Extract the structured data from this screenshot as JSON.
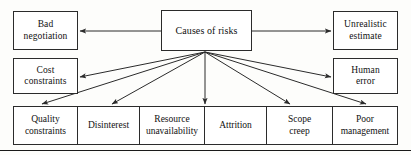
{
  "diagram": {
    "title": "Causes of risks",
    "type": "cause-and-effect-fan-diagram",
    "hub": {
      "label": "Causes of risks",
      "x": 161,
      "y": 10,
      "w": 91,
      "h": 41
    },
    "left_nodes": [
      {
        "id": "bad-negotiation",
        "label": "Bad negotiation",
        "line1": "Bad",
        "line2": "negotiation",
        "x": 13,
        "y": 11,
        "w": 65,
        "h": 39
      },
      {
        "id": "cost-constraints",
        "label": "Cost constraints",
        "line1": "Cost",
        "line2": "constraints",
        "x": 13,
        "y": 58,
        "w": 65,
        "h": 36
      }
    ],
    "right_nodes": [
      {
        "id": "unrealistic-estimate",
        "label": "Unrealistic estimate",
        "line1": "Unrealistic",
        "line2": "estimate",
        "x": 333,
        "y": 11,
        "w": 65,
        "h": 39
      },
      {
        "id": "human-error",
        "label": "Human error",
        "line1": "Human",
        "line2": "error",
        "x": 333,
        "y": 58,
        "w": 65,
        "h": 36
      }
    ],
    "bottom_nodes": [
      {
        "id": "quality-constraints",
        "label": "Quality constraints",
        "line1": "Quality",
        "line2": "constraints",
        "x": 13,
        "w": 65
      },
      {
        "id": "disinterest",
        "label": "Disinterest",
        "line1": "Disinterest",
        "line2": "",
        "x": 78,
        "w": 62
      },
      {
        "id": "resource-unavailability",
        "label": "Resource unavailability",
        "line1": "Resource",
        "line2": "unavailability",
        "x": 140,
        "w": 65
      },
      {
        "id": "attrition",
        "label": "Attrition",
        "line1": "Attrition",
        "line2": "",
        "x": 205,
        "w": 62
      },
      {
        "id": "scope-creep",
        "label": "Scope creep",
        "line1": "Scope",
        "line2": "creep",
        "x": 267,
        "w": 66
      },
      {
        "id": "poor-management",
        "label": "Poor management",
        "line1": "Poor",
        "line2": "management",
        "x": 333,
        "w": 65
      }
    ],
    "bottom_row": {
      "y": 106,
      "h": 39
    },
    "bottom_rule_y": 150,
    "connectors": [
      {
        "id": "hub-to-bad-negotiation",
        "from": "hub",
        "to": "bad-negotiation",
        "x1": 161,
        "y1": 31,
        "x2": 80,
        "y2": 31
      },
      {
        "id": "hub-to-unrealistic-estimate",
        "from": "hub",
        "to": "unrealistic-estimate",
        "x1": 252,
        "y1": 31,
        "x2": 331,
        "y2": 31
      },
      {
        "id": "hub-to-cost-constraints",
        "from": "hub",
        "to": "cost-constraints",
        "x1": 205,
        "y1": 52,
        "x2": 80,
        "y2": 77
      },
      {
        "id": "hub-to-human-error",
        "from": "hub",
        "to": "human-error",
        "x1": 205,
        "y1": 52,
        "x2": 331,
        "y2": 77
      },
      {
        "id": "hub-to-quality-constraints",
        "from": "hub",
        "to": "quality-constraints",
        "x1": 205,
        "y1": 52,
        "x2": 42,
        "y2": 104
      },
      {
        "id": "hub-to-disinterest",
        "from": "hub",
        "to": "disinterest",
        "x1": 205,
        "y1": 52,
        "x2": 112,
        "y2": 104
      },
      {
        "id": "hub-to-resource-unavailability",
        "from": "hub",
        "to": "resource-unavailability",
        "x1": 205,
        "y1": 52,
        "x2": 205,
        "y2": 104
      },
      {
        "id": "hub-to-scope-creep",
        "from": "hub",
        "to": "scope-creep",
        "x1": 205,
        "y1": 52,
        "x2": 290,
        "y2": 104
      },
      {
        "id": "hub-to-poor-management",
        "from": "hub",
        "to": "poor-management",
        "x1": 205,
        "y1": 52,
        "x2": 366,
        "y2": 104
      }
    ],
    "colors": {
      "stroke": "#2b2b2b",
      "box_fill": "#ffffff",
      "text": "#111111",
      "background": "#fdfdfb"
    }
  }
}
